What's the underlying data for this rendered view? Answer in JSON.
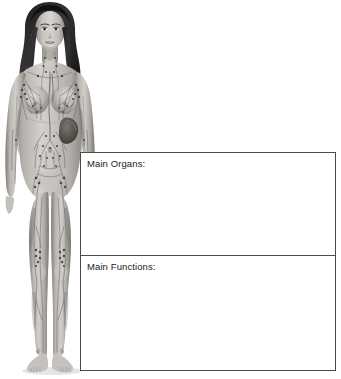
{
  "page": {
    "type": "anatomy-worksheet",
    "background_color": "#ffffff"
  },
  "illustration": {
    "name": "lymphatic-system-female-figure",
    "description": "Grayscale anatomical illustration of a standing female figure, front view, showing the lymphatic system with vessels and lymph nodes",
    "style": "grayscale medical illustration",
    "visible_structures": [
      "head",
      "long dark hair",
      "neck",
      "cervical lymph nodes",
      "thoracic duct",
      "axillary lymph nodes",
      "breasts with lymphatic vessels",
      "spleen",
      "abdominal lymphatic vessels",
      "cisterna chyli",
      "inguinal lymph nodes",
      "arms with lymphatic vessels",
      "legs with lymphatic vessels",
      "popliteal lymph nodes",
      "feet"
    ],
    "colors": {
      "skin_light": "#d9d6d2",
      "skin_mid": "#b4b0ac",
      "skin_shadow": "#8e8a86",
      "skin_deep_shadow": "#6d6965",
      "hair": "#2b2b2b",
      "vessel": "#6a6a6a",
      "node": "#4d4d4d",
      "spleen": "#5a5a5a"
    }
  },
  "boxes": [
    {
      "id": "organs",
      "label": "Main Organs:",
      "value": "",
      "placeholder": ""
    },
    {
      "id": "functions",
      "label": "Main Functions:",
      "value": "",
      "placeholder": ""
    }
  ],
  "style": {
    "border_color": "#4a4a4a",
    "text_color": "#1a1a1a"
  }
}
